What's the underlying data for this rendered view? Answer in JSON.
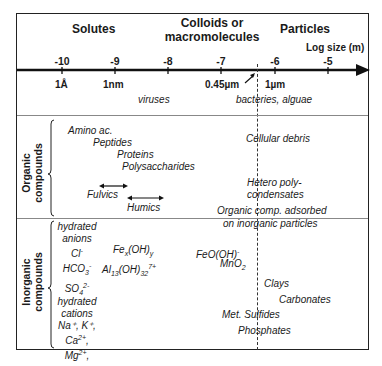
{
  "headers": {
    "solutes": "Solutes",
    "colloids_line1": "Colloids or",
    "colloids_line2": "macromolecules",
    "particles": "Particles",
    "axis_label": "Log size (m)"
  },
  "axis": {
    "ticks": [
      "-10",
      "-9",
      "-8",
      "-7",
      "-6",
      "-5"
    ],
    "units": {
      "angstrom": "1Å",
      "nm": "1nm",
      "filter": "0.45µm",
      "um": "1µm"
    }
  },
  "size_row": {
    "viruses": "viruses",
    "bacteria": "bacteries, alguae"
  },
  "organic": {
    "label_line1": "Organic",
    "label_line2": "compounds",
    "items": {
      "amino": "Amino ac.",
      "peptides": "Peptides",
      "proteins": "Proteins",
      "polysaccharides": "Polysaccharides",
      "fulvics": "Fulvics",
      "humics": "Humics",
      "cellular_debris": "Cellular debris",
      "hetero1": "Hetero poly-",
      "hetero2": "condensates",
      "adsorbed1": "Organic comp. adsorbed",
      "adsorbed2": "on inorganic particles"
    }
  },
  "inorganic": {
    "label_line1": "Inorganic",
    "label_line2": "compounds",
    "anions": {
      "title1": "hydrated",
      "title2": "anions",
      "cl": "Cl",
      "cl_sup": "-",
      "hco3": "HCO",
      "hco3_sub": "3",
      "hco3_sup": "-",
      "so4": "SO",
      "so4_sub": "4",
      "so4_sup": "2-"
    },
    "cations": {
      "title1": "hydrated",
      "title2": "cations",
      "line1": "Na⁺, K⁺,",
      "ca": "Ca",
      "ca_sup": "2+",
      "mg": "Mg",
      "mg_sup": "2+"
    },
    "fex": {
      "a": "Fe",
      "x": "x",
      "b": "(OH)",
      "y": "y"
    },
    "al": {
      "a": "Al",
      "sub1": "13",
      "b": "(OH)",
      "sub2": "32",
      "sup": "7+"
    },
    "feooh": {
      "a": "FeO(OH)",
      "sup": "-"
    },
    "mno2": {
      "a": "MnO",
      "sub": "2"
    },
    "clays": "Clays",
    "carbonates": "Carbonates",
    "sulfides": "Met. Sulfides",
    "phosphates": "Phosphates"
  },
  "colors": {
    "line": "#222222",
    "separator": "#888888",
    "text": "#1a1a1a"
  }
}
